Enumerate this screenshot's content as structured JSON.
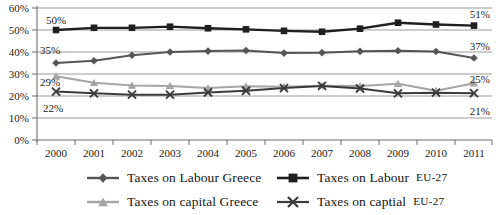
{
  "chart_data": {
    "type": "line",
    "title": "",
    "xlabel": "",
    "ylabel": "",
    "ylim": [
      0,
      60
    ],
    "ytick_values": [
      0,
      10,
      20,
      30,
      40,
      50,
      60
    ],
    "ytick_labels": [
      "0%",
      "10%",
      "20%",
      "30%",
      "40%",
      "50%",
      "60%"
    ],
    "grid": true,
    "legend_position": "bottom",
    "categories": [
      2000,
      2001,
      2002,
      2003,
      2004,
      2005,
      2006,
      2007,
      2008,
      2009,
      2010,
      2011
    ],
    "xtick_labels": [
      "2000",
      "2001",
      "2002",
      "2003",
      "2004",
      "2005",
      "2006",
      "2007",
      "2008",
      "2009",
      "2010",
      "2011"
    ],
    "series": [
      {
        "name": "Taxes on Labour Greece",
        "marker": "diamond",
        "color": "#555555",
        "values": [
          35.0,
          36.0,
          38.5,
          40.0,
          40.4,
          40.7,
          39.5,
          39.7,
          40.3,
          40.6,
          40.2,
          37.3
        ],
        "start_label": "35%",
        "end_label": "37%"
      },
      {
        "name": "Taxes on Labour EU-27",
        "marker": "square",
        "color": "#1f1f1f",
        "values": [
          50.0,
          51.0,
          51.0,
          51.5,
          50.8,
          50.3,
          49.6,
          49.2,
          50.6,
          53.3,
          52.5,
          52.0
        ],
        "start_label": "50%",
        "end_label": "51%"
      },
      {
        "name": "Taxes on capital Greece",
        "marker": "triangle",
        "color": "#a5a5a5",
        "values": [
          29.0,
          26.0,
          24.8,
          24.6,
          23.6,
          24.4,
          24.2,
          24.7,
          24.6,
          25.6,
          22.4,
          25.8
        ],
        "start_label": "29%",
        "end_label": "25%"
      },
      {
        "name": "Taxes on captial EU-27",
        "marker": "x",
        "color": "#3b3b3b",
        "values": [
          22.0,
          21.2,
          20.6,
          20.6,
          21.6,
          22.4,
          23.6,
          24.6,
          23.4,
          21.2,
          21.5,
          21.3
        ],
        "start_label": "22%",
        "end_label": "21%"
      }
    ],
    "point_labels": {
      "start": [
        "50%",
        "35%",
        "29%",
        "22%"
      ],
      "end": [
        "51%",
        "37%",
        "25%",
        "21%"
      ]
    }
  },
  "legend": {
    "items": [
      {
        "label_main": "Taxes on Labour Greece",
        "label_sc": "",
        "marker": "diamond"
      },
      {
        "label_main": "Taxes on Labour ",
        "label_sc": "EU-27",
        "marker": "square"
      },
      {
        "label_main": "Taxes on capital Greece",
        "label_sc": "",
        "marker": "triangle"
      },
      {
        "label_main": "Taxes on captial ",
        "label_sc": "EU-27",
        "marker": "x"
      }
    ]
  },
  "labels": {
    "y_60": "60%",
    "y_50": "50%",
    "y_40": "40%",
    "y_30": "30%",
    "y_20": "20%",
    "y_10": "10%",
    "y_0": "0%",
    "x_2000": "2000",
    "x_2001": "2001",
    "x_2002": "2002",
    "x_2003": "2003",
    "x_2004": "2004",
    "x_2005": "2005",
    "x_2006": "2006",
    "x_2007": "2007",
    "x_2008": "2008",
    "x_2009": "2009",
    "x_2010": "2010",
    "x_2011": "2011",
    "lbl_labour_gr_start": "35%",
    "lbl_labour_gr_end": "37%",
    "lbl_labour_eu_start": "50%",
    "lbl_labour_eu_end": "51%",
    "lbl_capital_gr_start": "29%",
    "lbl_capital_gr_end": "25%",
    "lbl_capital_eu_start": "22%",
    "lbl_capital_eu_end": "21%"
  }
}
